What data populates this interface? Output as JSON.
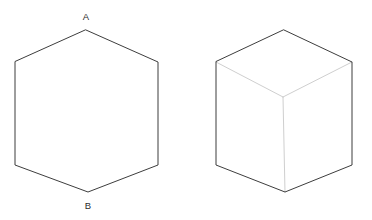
{
  "canvas": {
    "width": 372,
    "height": 220,
    "background": "#ffffff"
  },
  "style": {
    "outline_color": "#3d3d3d",
    "outline_width": 1,
    "interior_color": "#cfcfcf",
    "interior_width": 1,
    "label_color": "#2b2b2b",
    "label_font_size": 9.5
  },
  "figures": [
    {
      "id": "hexagon",
      "name": "plain-hexagon",
      "type": "polygon",
      "sides": 6,
      "description": "Regular hexagon outline with labelled top and bottom vertices",
      "fill": "none",
      "stroke": "#3d3d3d",
      "points": "86,30 158,62 158,165 88,192 15,165 15,62",
      "vertices": [
        {
          "name": "top-apex",
          "x": 86,
          "y": 30,
          "label": "A"
        },
        {
          "name": "upper-right",
          "x": 158,
          "y": 62,
          "label": ""
        },
        {
          "name": "lower-right",
          "x": 158,
          "y": 165,
          "label": ""
        },
        {
          "name": "bottom-apex",
          "x": 88,
          "y": 192,
          "label": "B"
        },
        {
          "name": "lower-left",
          "x": 15,
          "y": 165,
          "label": ""
        },
        {
          "name": "upper-left",
          "x": 15,
          "y": 62,
          "label": ""
        }
      ],
      "labels": [
        {
          "name": "label-a",
          "text": "A",
          "x": 86,
          "y": 17
        },
        {
          "name": "label-b",
          "text": "B",
          "x": 88,
          "y": 206
        }
      ]
    },
    {
      "id": "cube",
      "name": "isometric-cube",
      "type": "cube-isometric",
      "description": "Cube drawn in isometric projection; hexagonal silhouette with three interior edges meeting at the centre vertex",
      "fill": "none",
      "stroke": "#3d3d3d",
      "outline_points": "284,30 352,62 352,165 285,192 216,165 216,62",
      "outline_vertices": [
        {
          "name": "top-apex",
          "x": 284,
          "y": 30
        },
        {
          "name": "upper-right",
          "x": 352,
          "y": 62
        },
        {
          "name": "lower-right",
          "x": 352,
          "y": 165
        },
        {
          "name": "bottom-apex",
          "x": 285,
          "y": 192
        },
        {
          "name": "lower-left",
          "x": 216,
          "y": 165
        },
        {
          "name": "upper-left",
          "x": 216,
          "y": 62
        }
      ],
      "center_vertex": {
        "name": "centre-vertex",
        "x": 283,
        "y": 97
      },
      "interior_edges": [
        {
          "name": "edge-centre-to-upper-left",
          "x1": 283,
          "y1": 97,
          "x2": 216,
          "y2": 62
        },
        {
          "name": "edge-centre-to-upper-right",
          "x1": 283,
          "y1": 97,
          "x2": 352,
          "y2": 62
        },
        {
          "name": "edge-centre-to-bottom-apex",
          "x1": 283,
          "y1": 97,
          "x2": 285,
          "y2": 192
        }
      ],
      "labels": []
    }
  ]
}
